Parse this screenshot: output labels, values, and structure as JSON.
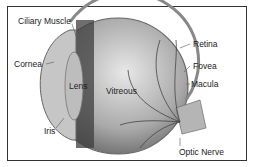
{
  "diagram": {
    "labels": {
      "ciliary_muscle": "Ciliary Muscle",
      "cornea": "Cornea",
      "lens": "Lens",
      "vitreous": "Vitreous",
      "iris": "Iris",
      "retina": "Retina",
      "fovea": "Fovea",
      "macula": "Macula",
      "optic_nerve": "Optic Nerve"
    }
  }
}
